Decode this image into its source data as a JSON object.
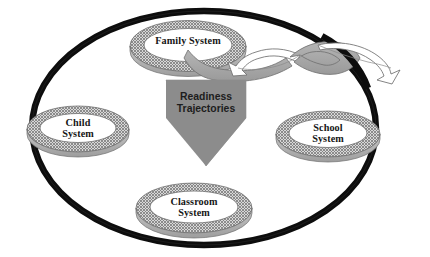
{
  "diagram": {
    "type": "ecological-systems-nested-diagram",
    "title_text": "",
    "outer_boundary": {
      "name": "outer-ellipse-boundary",
      "shape": "ellipse",
      "stroke_color": "#0d0d0d",
      "fill_color": "#ffffff",
      "stroke_width_px": 6
    },
    "nodes": [
      {
        "id": "family-system",
        "label": "Family System",
        "shape": "torus-ellipse",
        "ring_fill": "#b9b9b9",
        "ring_texture": "crosshatch",
        "interior_fill": "#ffffff"
      },
      {
        "id": "child-system",
        "label": "Child\nSystem",
        "shape": "torus-ellipse",
        "ring_fill": "#b9b9b9",
        "ring_texture": "crosshatch",
        "interior_fill": "#ffffff"
      },
      {
        "id": "school-system",
        "label": "School\nSystem",
        "shape": "torus-ellipse",
        "ring_fill": "#b9b9b9",
        "ring_texture": "crosshatch",
        "interior_fill": "#ffffff"
      },
      {
        "id": "classroom-system",
        "label": "Classroom\nSystem",
        "shape": "torus-ellipse",
        "ring_fill": "#b9b9b9",
        "ring_texture": "crosshatch",
        "interior_fill": "#ffffff"
      }
    ],
    "center_arrow": {
      "id": "readiness-trajectories-arrow",
      "label": "Readiness\nTrajectories",
      "direction": "down",
      "fill_color": "#8c8c8c",
      "text_color": "#1d1d1d"
    },
    "flow_ribbons": [
      {
        "id": "family-to-center-ribbon",
        "from": "family-system",
        "to": "readiness-trajectories-arrow",
        "style": "gray-curved-ribbon",
        "fill_color": "#a8a8a8"
      },
      {
        "id": "inbound-ribbon-arrow",
        "direction": "left-inward",
        "style": "white-outlined-ribbon-arrow",
        "fill_color": "#ffffff",
        "stroke_color": "#6d6d6d"
      },
      {
        "id": "outbound-ribbon-arrow",
        "direction": "right-outward",
        "style": "gray-to-white-outlined-ribbon-arrow",
        "fill_color": "#a8a8a8",
        "stroke_color": "#6d6d6d"
      }
    ]
  }
}
